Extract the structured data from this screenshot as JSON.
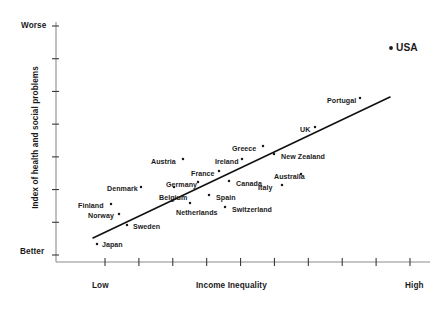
{
  "chart_data": {
    "type": "scatter",
    "title": "",
    "xlabel": "Income Inequality",
    "ylabel": "Index of health and social problems",
    "x_tick_labels": [
      "Low",
      "High"
    ],
    "y_tick_labels": [
      "Worse",
      "Better"
    ],
    "x_axis_low_label": "Low",
    "x_axis_high_label": "High",
    "y_axis_top_label": "Worse",
    "y_axis_bottom_label": "Better",
    "grid": false,
    "legend": "none",
    "x_tick_count": 10,
    "y_tick_count": 8,
    "marker_color": "#1a1a1a",
    "trend_line_color": "#111111",
    "axis_color": "#8c8c8c",
    "trendline": {
      "show": true,
      "x0_px": 93,
      "y0_px": 238,
      "x1_px": 390,
      "y1_px": 97
    },
    "points": [
      {
        "name": "Japan",
        "px": 98,
        "py": 245,
        "label_x": 102,
        "label_y": 241,
        "label_align": "left",
        "marker_x": 97,
        "marker_y": 244
      },
      {
        "name": "Norway",
        "px": 118,
        "py": 215,
        "label_x": 88,
        "label_y": 212,
        "label_align": "left",
        "marker_x": 119,
        "marker_y": 214
      },
      {
        "name": "Sweden",
        "px": 128,
        "py": 226,
        "label_x": 133,
        "label_y": 223,
        "label_align": "left",
        "marker_x": 127,
        "marker_y": 225
      },
      {
        "name": "Finland",
        "px": 110,
        "py": 205,
        "label_x": 78,
        "label_y": 202,
        "label_align": "left",
        "marker_x": 111,
        "marker_y": 204
      },
      {
        "name": "Denmark",
        "px": 140,
        "py": 188,
        "label_x": 107,
        "label_y": 185,
        "label_align": "left",
        "marker_x": 141,
        "marker_y": 187
      },
      {
        "name": "Belgium",
        "px": 172,
        "py": 191,
        "label_x": 159,
        "label_y": 194,
        "label_align": "left",
        "marker_x": 174,
        "marker_y": 187
      },
      {
        "name": "Netherlands",
        "px": 188,
        "py": 206,
        "label_x": 176,
        "label_y": 209,
        "label_align": "left",
        "marker_x": 190,
        "marker_y": 203
      },
      {
        "name": "Germany",
        "px": 197,
        "py": 183,
        "label_x": 166,
        "label_y": 181,
        "label_align": "left",
        "marker_x": 198,
        "marker_y": 182
      },
      {
        "name": "Austria",
        "px": 182,
        "py": 160,
        "label_x": 151,
        "label_y": 158,
        "label_align": "left",
        "marker_x": 183,
        "marker_y": 159
      },
      {
        "name": "France",
        "px": 218,
        "py": 172,
        "label_x": 191,
        "label_y": 170,
        "label_align": "left",
        "marker_x": 219,
        "marker_y": 171
      },
      {
        "name": "Ireland",
        "px": 241,
        "py": 160,
        "label_x": 215,
        "label_y": 158,
        "label_align": "left",
        "marker_x": 242,
        "marker_y": 159
      },
      {
        "name": "Spain",
        "px": 210,
        "py": 196,
        "label_x": 216,
        "label_y": 194,
        "label_align": "left",
        "marker_x": 209,
        "marker_y": 195
      },
      {
        "name": "Switzerland",
        "px": 226,
        "py": 208,
        "label_x": 232,
        "label_y": 206,
        "label_align": "left",
        "marker_x": 225,
        "marker_y": 207
      },
      {
        "name": "Canada",
        "px": 230,
        "py": 182,
        "label_x": 236,
        "label_y": 180,
        "label_align": "left",
        "marker_x": 229,
        "marker_y": 181
      },
      {
        "name": "Italy",
        "px": 281,
        "py": 186,
        "label_x": 258,
        "label_y": 184,
        "label_align": "left",
        "marker_x": 282,
        "marker_y": 185
      },
      {
        "name": "Greece",
        "px": 262,
        "py": 147,
        "label_x": 232,
        "label_y": 145,
        "label_align": "left",
        "marker_x": 263,
        "marker_y": 146
      },
      {
        "name": "Australia",
        "px": 300,
        "py": 175,
        "label_x": 274,
        "label_y": 173,
        "label_align": "left",
        "marker_x": 301,
        "marker_y": 174
      },
      {
        "name": "New Zealand",
        "px": 275,
        "py": 155,
        "label_x": 281,
        "label_y": 153,
        "label_align": "left",
        "marker_x": 274,
        "marker_y": 154
      },
      {
        "name": "UK",
        "px": 314,
        "py": 128,
        "label_x": 300,
        "label_y": 126,
        "label_align": "left",
        "marker_x": 315,
        "marker_y": 127
      },
      {
        "name": "Portugal",
        "px": 359,
        "py": 99,
        "label_x": 327,
        "label_y": 97,
        "label_align": "left",
        "marker_x": 360,
        "marker_y": 98
      },
      {
        "name": "USA",
        "px": 392,
        "py": 48,
        "label_x": 396,
        "label_y": 42,
        "label_align": "left",
        "marker_x": 391,
        "marker_y": 48,
        "emphasis": true
      }
    ]
  },
  "axes": {
    "y": {
      "top_label": "Worse",
      "bottom_label": "Better",
      "title": "Index of health and social problems"
    },
    "x": {
      "low_label": "Low",
      "high_label": "High",
      "title": "Income Inequality"
    }
  }
}
